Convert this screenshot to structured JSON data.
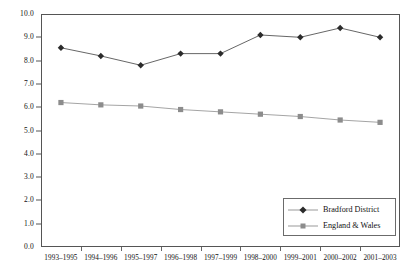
{
  "chart_data": {
    "type": "line",
    "title": "",
    "xlabel": "",
    "ylabel": "",
    "ylim": [
      0.0,
      10.0
    ],
    "ytick_step": 1.0,
    "grid": false,
    "legend_position": "lower-right",
    "categories": [
      "1993–1995",
      "1994–1996",
      "1995–1997",
      "1996–1998",
      "1997–1999",
      "1998–2000",
      "1999–2001",
      "2000–2002",
      "2001–2003"
    ],
    "ytick_labels": [
      "0.0",
      "1.0",
      "2.0",
      "3.0",
      "4.0",
      "5.0",
      "6.0",
      "7.0",
      "8.0",
      "9.0",
      "10.0"
    ],
    "series": [
      {
        "name": "Bradford District",
        "marker": "diamond",
        "color": "#2b2b2b",
        "line_color": "#555555",
        "values": [
          8.55,
          8.2,
          7.8,
          8.3,
          8.3,
          9.1,
          9.0,
          9.4,
          9.0
        ]
      },
      {
        "name": "England & Wales",
        "marker": "square",
        "color": "#8c8c8c",
        "line_color": "#9a9a9a",
        "values": [
          6.2,
          6.1,
          6.05,
          5.9,
          5.8,
          5.7,
          5.6,
          5.45,
          5.35
        ]
      }
    ]
  },
  "legend": {
    "items": [
      {
        "label": "Bradford District"
      },
      {
        "label": "England & Wales"
      }
    ]
  }
}
